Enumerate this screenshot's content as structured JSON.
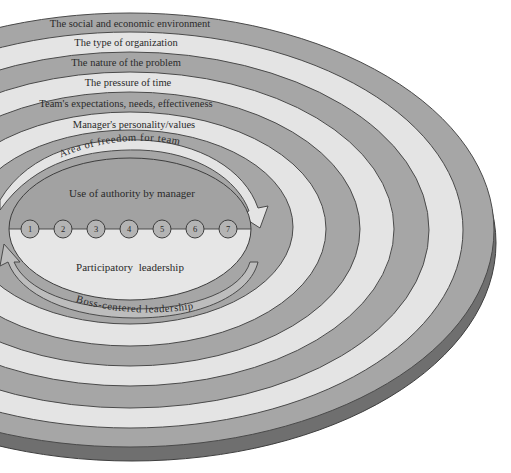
{
  "diagram": {
    "type": "concentric-ellipse-continuum",
    "colors": {
      "dark_band": "#a6a6a6",
      "light_band": "#e4e4e4",
      "rim": "#6f6f6f",
      "outline": "#4a4a4a",
      "inner_upper": "#a2a2a2",
      "inner_lower": "#e6e6e6",
      "text": "#2a2a2a",
      "background": "#ffffff"
    },
    "rings": [
      {
        "label": "The social and economic environment",
        "shade": "dark"
      },
      {
        "label": "The type of organization",
        "shade": "light"
      },
      {
        "label": "The nature of the problem",
        "shade": "dark"
      },
      {
        "label": "The pressure of time",
        "shade": "light"
      },
      {
        "label": "Team's expectations, needs, effectiveness",
        "shade": "dark"
      },
      {
        "label": "Manager's personality/values",
        "shade": "light"
      }
    ],
    "arrows": {
      "top": "Area of freedom for team",
      "bottom": "Boss-centered leadership"
    },
    "center": {
      "upper_label": "Use of authority by manager",
      "lower_label": "Participatory leadership",
      "scale": [
        "1",
        "2",
        "3",
        "4",
        "5",
        "6",
        "7"
      ]
    }
  }
}
